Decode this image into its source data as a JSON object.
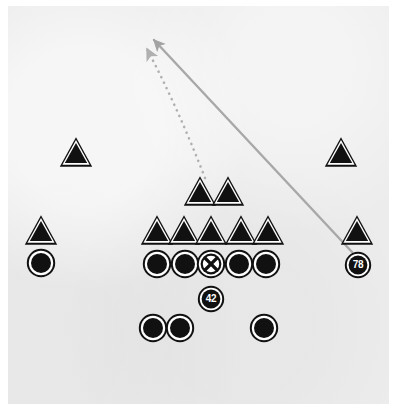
{
  "diagram": {
    "field_color": "#ececed",
    "page_color": "#ffffff",
    "marker_fill": "#111111",
    "marker_outline": "#ffffff",
    "marker_edge": "#111111",
    "route_color": "#a8a8a8",
    "ball_marker_fill": "#ffffff"
  },
  "defense": {
    "label": "defense-triangles",
    "players": [
      {
        "name": "defender-left-outside",
        "x": 76,
        "y": 154
      },
      {
        "name": "defender-right-outside",
        "x": 341,
        "y": 154
      },
      {
        "name": "defender-left-wide",
        "x": 41,
        "y": 232
      },
      {
        "name": "defender-right-wide",
        "x": 357,
        "y": 232
      },
      {
        "name": "linebacker-left",
        "x": 200,
        "y": 193
      },
      {
        "name": "linebacker-right",
        "x": 228,
        "y": 193
      },
      {
        "name": "lineman-1",
        "x": 157,
        "y": 232
      },
      {
        "name": "lineman-2",
        "x": 184,
        "y": 232
      },
      {
        "name": "lineman-3",
        "x": 211,
        "y": 232
      },
      {
        "name": "lineman-4",
        "x": 241,
        "y": 232
      },
      {
        "name": "lineman-5",
        "x": 268,
        "y": 232
      }
    ]
  },
  "offense": {
    "label": "offense-circles",
    "players": [
      {
        "name": "receiver-left-wide",
        "x": 41,
        "y": 265
      },
      {
        "name": "lineman-left-tackle",
        "x": 157,
        "y": 266
      },
      {
        "name": "lineman-left-guard",
        "x": 185,
        "y": 266
      },
      {
        "name": "lineman-right-guard",
        "x": 239,
        "y": 266
      },
      {
        "name": "lineman-right-tackle",
        "x": 266,
        "y": 266
      },
      {
        "name": "back-left",
        "x": 153,
        "y": 330
      },
      {
        "name": "back-middle",
        "x": 180,
        "y": 330
      },
      {
        "name": "back-right",
        "x": 264,
        "y": 330
      }
    ],
    "center": {
      "name": "center-ball-marker",
      "x": 211,
      "y": 266,
      "symbol": "X"
    },
    "numbered": [
      {
        "name": "player-42",
        "x": 211,
        "y": 299,
        "number": "42"
      },
      {
        "name": "player-78",
        "x": 358,
        "y": 265,
        "number": "78"
      }
    ]
  },
  "routes": [
    {
      "name": "route-solid-player-78",
      "style": "solid",
      "start_x": 352,
      "start_y": 252,
      "end_x": 154,
      "end_y": 40,
      "color": "#a8a8a8",
      "width": 2.4
    },
    {
      "name": "route-dotted-player-42",
      "style": "dotted",
      "start_x": 205,
      "start_y": 178,
      "mid_x": 178,
      "mid_y": 108,
      "end_x": 147,
      "end_y": 49,
      "color": "#b0b0b0",
      "width": 2.6
    }
  ]
}
